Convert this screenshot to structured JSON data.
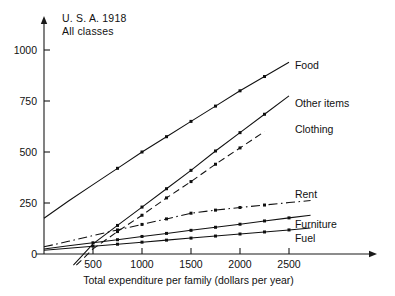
{
  "chart_data": {
    "type": "line",
    "title": "",
    "annotation_lines": [
      "U. S. A.   1918",
      "All classes"
    ],
    "xlabel": "Total expenditure per family (dollars per year)",
    "ylabel": "",
    "xlim": [
      0,
      2800
    ],
    "ylim": [
      -60,
      1080
    ],
    "xticks": [
      500,
      1000,
      1500,
      2000,
      2500
    ],
    "xtick_labels": [
      "500",
      "1000",
      "1500",
      "2000",
      "2500"
    ],
    "yticks": [
      0,
      250,
      500,
      750,
      1000
    ],
    "ytick_labels": [
      "0",
      "250",
      "500",
      "750",
      "1000"
    ],
    "grid": false,
    "legend_position": "right-inline-labels",
    "series": [
      {
        "name": "Food",
        "label": "Food",
        "style": "solid",
        "x": [
          0,
          250,
          500,
          750,
          1000,
          1250,
          1500,
          1750,
          2000,
          2250,
          2500
        ],
        "y": [
          175,
          260,
          340,
          420,
          500,
          575,
          650,
          725,
          800,
          870,
          940
        ],
        "markers_x": [
          750,
          1000,
          1250,
          1500,
          1750,
          2000,
          2250
        ],
        "markers_y": [
          420,
          500,
          575,
          650,
          725,
          800,
          870
        ],
        "label_x": 2560,
        "label_y": 925
      },
      {
        "name": "Other items",
        "label": "Other items",
        "style": "solid",
        "x": [
          300,
          500,
          750,
          1000,
          1250,
          1500,
          1750,
          2000,
          2250,
          2500
        ],
        "y": [
          -55,
          50,
          140,
          230,
          320,
          410,
          505,
          595,
          685,
          775
        ],
        "markers_x": [
          750,
          1000,
          1250,
          1500,
          1750,
          2000,
          2250
        ],
        "markers_y": [
          140,
          230,
          320,
          410,
          505,
          595,
          685
        ],
        "label_x": 2560,
        "label_y": 740
      },
      {
        "name": "Clothing",
        "label": "Clothing",
        "style": "dashed",
        "x": [
          330,
          500,
          750,
          1000,
          1250,
          1500,
          1750,
          2000,
          2250
        ],
        "y": [
          -55,
          25,
          110,
          190,
          275,
          355,
          440,
          520,
          600
        ],
        "markers_x": [
          750,
          1000,
          1250,
          1500,
          1750,
          2000
        ],
        "markers_y": [
          110,
          190,
          275,
          355,
          440,
          520
        ],
        "label_x": 2560,
        "label_y": 615
      },
      {
        "name": "Rent",
        "label": "Rent",
        "style": "dash-dot",
        "x": [
          0,
          250,
          500,
          750,
          1000,
          1250,
          1500,
          1750,
          2000,
          2250,
          2500,
          2720
        ],
        "y": [
          35,
          62,
          90,
          118,
          145,
          172,
          200,
          215,
          228,
          240,
          252,
          262
        ],
        "markers_x": [
          750,
          1000,
          1250,
          1500,
          1750,
          2000,
          2250
        ],
        "markers_y": [
          118,
          145,
          172,
          200,
          215,
          228,
          240
        ],
        "label_x": 2560,
        "label_y": 295
      },
      {
        "name": "Furniture",
        "label": "Furniture",
        "style": "solid",
        "x": [
          0,
          250,
          500,
          750,
          1000,
          1250,
          1500,
          1750,
          2000,
          2250,
          2500,
          2720
        ],
        "y": [
          25,
          40,
          55,
          70,
          86,
          101,
          116,
          131,
          146,
          162,
          177,
          190
        ],
        "markers_x": [
          500,
          750,
          1000,
          1250,
          1500,
          1750,
          2000,
          2250,
          2500
        ],
        "markers_y": [
          55,
          70,
          86,
          101,
          116,
          131,
          146,
          162,
          177
        ],
        "label_x": 2560,
        "label_y": 145
      },
      {
        "name": "Fuel",
        "label": "Fuel",
        "style": "solid",
        "x": [
          0,
          250,
          500,
          750,
          1000,
          1250,
          1500,
          1750,
          2000,
          2250,
          2500,
          2720
        ],
        "y": [
          18,
          28,
          38,
          48,
          58,
          68,
          78,
          88,
          98,
          108,
          118,
          127
        ],
        "markers_x": [
          500,
          750,
          1000,
          1250,
          1500,
          1750,
          2000,
          2250,
          2500
        ],
        "markers_y": [
          38,
          48,
          58,
          68,
          78,
          88,
          98,
          108,
          118
        ],
        "label_x": 2560,
        "label_y": 80
      }
    ],
    "colors": {
      "ink": "#111111",
      "background": "#ffffff"
    }
  }
}
